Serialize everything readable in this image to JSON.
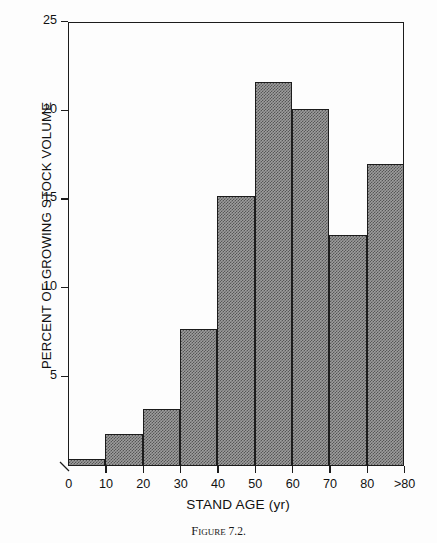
{
  "figure": {
    "caption_prefix": "Figure",
    "caption_number": "7.2.",
    "caption_full": "Figure 7.2."
  },
  "chart_data": {
    "type": "bar",
    "title": "",
    "subtitle": "",
    "xlabel": "STAND AGE (yr)",
    "ylabel": "PERCENT OF GROWING STOCK VOLUME",
    "categories": [
      "0-10",
      "10-20",
      "20-30",
      "30-40",
      "40-50",
      "50-60",
      "60-70",
      "70-80",
      ">80"
    ],
    "bin_edges": [
      0,
      10,
      20,
      30,
      40,
      50,
      60,
      70,
      80,
      90
    ],
    "values": [
      0.4,
      1.8,
      3.2,
      7.7,
      15.2,
      21.6,
      20.1,
      13.0,
      17.0
    ],
    "xlim": [
      0,
      90
    ],
    "ylim": [
      0,
      25
    ],
    "xticks": [
      0,
      10,
      20,
      30,
      40,
      50,
      60,
      70,
      80,
      90
    ],
    "xticklabels": [
      "0",
      "10",
      "20",
      "30",
      "40",
      "50",
      "60",
      "70",
      "80",
      ">80"
    ],
    "yticks": [
      0,
      5,
      10,
      15,
      20,
      25
    ],
    "yticklabels": [
      "0",
      "5",
      "10",
      "15",
      "20",
      "25"
    ],
    "grid": false,
    "legend": null,
    "bar_fill_color": "#9d9d9d",
    "bar_edge_color": "#1c1c1c",
    "axis_color": "#1c1c1c",
    "background_color": "#ffffff"
  }
}
